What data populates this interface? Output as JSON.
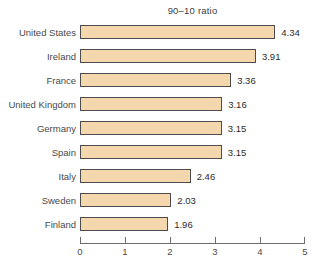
{
  "chart_data": {
    "type": "bar",
    "orientation": "horizontal",
    "title": "90–10 ratio",
    "categories": [
      "United States",
      "Ireland",
      "France",
      "United Kingdom",
      "Germany",
      "Spain",
      "Italy",
      "Sweden",
      "Finland"
    ],
    "values": [
      4.34,
      3.91,
      3.36,
      3.16,
      3.15,
      3.15,
      2.46,
      2.03,
      1.96
    ],
    "value_labels": [
      "4.34",
      "3.91",
      "3.36",
      "3.16",
      "3.15",
      "3.15",
      "2.46",
      "2.03",
      "1.96"
    ],
    "xlabel": "",
    "ylabel": "",
    "xlim": [
      0,
      5
    ],
    "x_ticks": [
      "0",
      "1",
      "2",
      "3",
      "4",
      "5"
    ],
    "grid": false,
    "legend": "none",
    "bar_fill_color": "#f5d7ad",
    "bar_border_color": "#4d4d4d",
    "axis_color": "#6e6e6e",
    "text_color": "#4a4a4a"
  }
}
